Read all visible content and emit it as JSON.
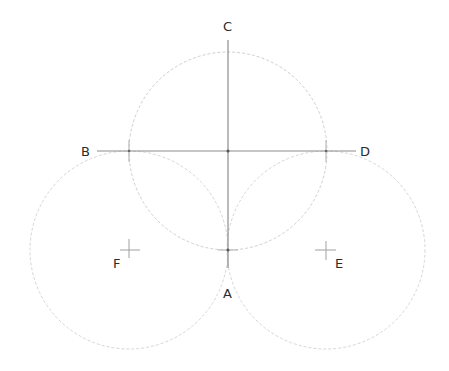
{
  "diagram": {
    "type": "geometric-construction",
    "labels": {
      "A": "A",
      "B": "B",
      "C": "C",
      "D": "D",
      "E": "E",
      "F": "F"
    },
    "points": {
      "center": [
        228,
        151
      ],
      "B_int": [
        129,
        151
      ],
      "D_int": [
        326,
        151
      ],
      "A_pt": [
        228,
        250
      ],
      "F": [
        129,
        250
      ],
      "E": [
        326,
        250
      ]
    },
    "radius": 99,
    "colors": {
      "circle": "#c8c8c8",
      "line": "#8a8a8a",
      "text": "#2b2b2b",
      "background": "#ffffff"
    }
  }
}
